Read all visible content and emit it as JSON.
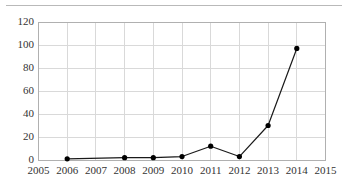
{
  "chart_data": {
    "type": "line",
    "title": "",
    "subtitle": "",
    "xlabel": "",
    "ylabel": "",
    "x": [
      2005,
      2006,
      2007,
      2008,
      2009,
      2010,
      2011,
      2012,
      2013,
      2014,
      2015
    ],
    "xtick_labels": [
      "2005",
      "2006",
      "2007",
      "2008",
      "2009",
      "2010",
      "2011",
      "2012",
      "2013",
      "2014",
      "2015"
    ],
    "ytick_labels": [
      "0",
      "20",
      "40",
      "60",
      "80",
      "100",
      "120"
    ],
    "yticks": [
      0,
      20,
      40,
      60,
      80,
      100,
      120
    ],
    "xlim": [
      2005,
      2015
    ],
    "ylim": [
      0,
      120
    ],
    "grid": true,
    "legend": false,
    "legend_position": "none",
    "series": [
      {
        "name": "",
        "color": "#1a1a1a",
        "marker": "circle",
        "marker_color": "#000000",
        "x": [
          2006,
          2008,
          2009,
          2010,
          2011,
          2012,
          2013,
          2014
        ],
        "values": [
          1,
          2,
          2,
          3,
          12,
          3,
          30,
          97
        ],
        "points": [
          {
            "x": 2006,
            "y": 1
          },
          {
            "x": 2008,
            "y": 2
          },
          {
            "x": 2009,
            "y": 2
          },
          {
            "x": 2010,
            "y": 3
          },
          {
            "x": 2011,
            "y": 12
          },
          {
            "x": 2012,
            "y": 3
          },
          {
            "x": 2013,
            "y": 30
          },
          {
            "x": 2014,
            "y": 97
          }
        ]
      }
    ],
    "annotations": []
  },
  "style": {
    "grid_color": "#d9d9d9",
    "axis_color": "#b0b0b0",
    "line_color": "#1a1a1a",
    "marker_color": "#000000",
    "tick_text_color": "#333333",
    "background": "#ffffff",
    "top_rule_color": "#b9b9b9"
  }
}
